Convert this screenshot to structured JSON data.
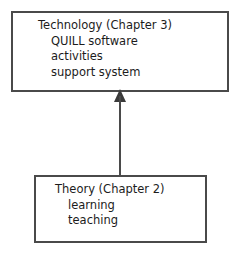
{
  "diagram": {
    "title": "",
    "background_color": "#ffffff",
    "stroke_color": "#4a4a4a",
    "text_color": "#1c1c1c",
    "nodes": [
      {
        "id": "technology",
        "title": "Technology (Chapter 3)",
        "items": [
          "QUILL software",
          "activities",
          "support system"
        ]
      },
      {
        "id": "theory",
        "title": "Theory (Chapter 2)",
        "items": [
          "learning",
          "teaching"
        ]
      }
    ],
    "edges": [
      {
        "id": "theory-to-technology",
        "from": "theory",
        "to": "technology",
        "direction": "up",
        "arrowhead": "filled-triangle",
        "style": "solid"
      }
    ]
  }
}
